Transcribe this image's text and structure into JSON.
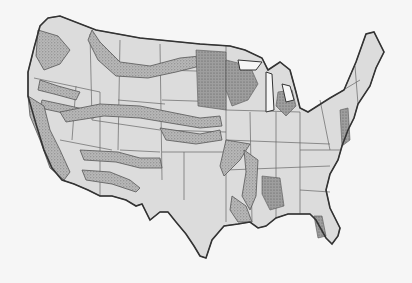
{
  "map": {
    "title": "",
    "subject": "Contiguous United States with state boundaries and stippled regional bands",
    "colors": {
      "land": "#dcdcdc",
      "stipple": "#9a9a9a",
      "border": "#555555",
      "background": "#f6f6f6"
    },
    "regions": [
      {
        "name": "Pacific Northwest bands"
      },
      {
        "name": "Northern Rockies band"
      },
      {
        "name": "Central Plains band"
      },
      {
        "name": "Southwest bands"
      },
      {
        "name": "Upper Midwest / Great Lakes shaded areas"
      },
      {
        "name": "Mississippi Valley bands"
      },
      {
        "name": "Gulf Coast bands"
      }
    ]
  }
}
